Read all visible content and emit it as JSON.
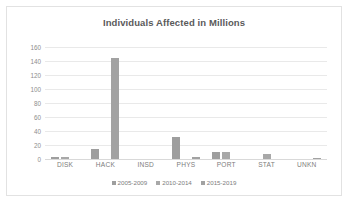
{
  "chart_data": {
    "type": "bar",
    "title": "Individuals Affected in Millions",
    "xlabel": "",
    "ylabel": "",
    "ylim": [
      0,
      160
    ],
    "yticks": [
      160,
      140,
      120,
      100,
      80,
      60,
      40,
      20,
      0
    ],
    "grid": true,
    "legend_position": "bottom",
    "categories": [
      "DISK",
      "HACK",
      "INSD",
      "PHYS",
      "PORT",
      "STAT",
      "UNKN"
    ],
    "series": [
      {
        "name": "2005-2009",
        "values": [
          3,
          14,
          0,
          31,
          10,
          0,
          0
        ]
      },
      {
        "name": "2010-2014",
        "values": [
          3,
          0,
          0,
          0,
          10,
          7,
          0
        ]
      },
      {
        "name": "2015-2019",
        "values": [
          0,
          145,
          0,
          3,
          0,
          0,
          2
        ]
      }
    ],
    "colors": {
      "series_2005_2009": "#9e9e9e",
      "series_2010_2014": "#a8a8a8",
      "series_2015_2019": "#a2a2a2",
      "gridline": "#e9e9e9",
      "title_text": "#5a5a5a",
      "tick_text": "#8d8d8d",
      "plot_background": "#ffffff",
      "frame_border": "#e2e2e2"
    }
  }
}
